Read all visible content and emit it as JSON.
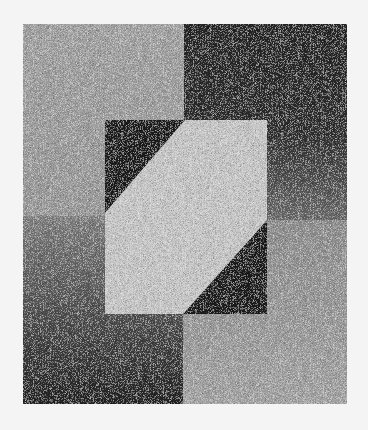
{
  "canvas": {
    "width": 368,
    "height": 430,
    "background": "#f4f4f4"
  },
  "frame": {
    "x": 23,
    "y": 24,
    "width": 324,
    "height": 380
  },
  "panels": {
    "top_left": {
      "x": 23,
      "y": 24,
      "width": 161,
      "height": 192,
      "color_top": "#a2a2a2",
      "color_bottom": "#9a9a9a"
    },
    "bottom_left": {
      "x": 23,
      "y": 216,
      "width": 160,
      "height": 188,
      "color_top": "#808080",
      "color_bottom": "#222222"
    },
    "top_right": {
      "x": 184,
      "y": 24,
      "width": 163,
      "height": 196,
      "color_top": "#252525",
      "color_bottom": "#6a6a6a"
    },
    "bottom_right": {
      "x": 183,
      "y": 220,
      "width": 164,
      "height": 184,
      "color_top": "#8e8e8e",
      "color_bottom": "#a4a4a4"
    }
  },
  "inner_rect": {
    "x": 105,
    "y": 120,
    "width": 162,
    "height": 194
  },
  "triangles": {
    "top_left": {
      "points": "105,120 185,120 105,213",
      "color": "#1c1c1c"
    },
    "bottom_right": {
      "points": "267,220 267,314 183,314",
      "color": "#1c1c1c"
    }
  },
  "hexagon": {
    "points": "185,120 267,120 267,220 183,314 105,314 105,213",
    "color": "#c6c6c6"
  },
  "noise": {
    "amount": 0.55
  }
}
